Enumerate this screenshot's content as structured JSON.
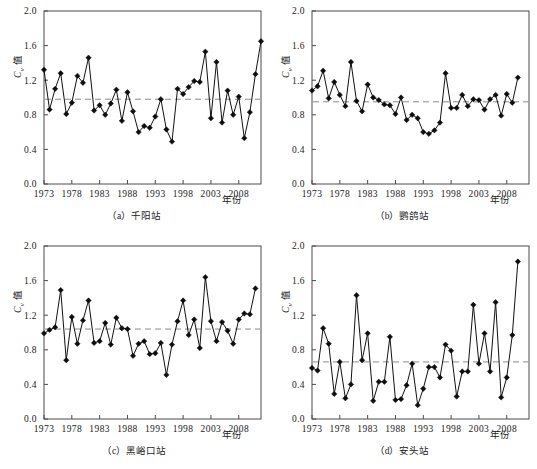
{
  "figure": {
    "ylabel_main": "C",
    "ylabel_sub": "v",
    "ylabel_unit": "值",
    "xlabel": "年份",
    "y_ticks": [
      "0.0",
      "0.4",
      "0.8",
      "1.2",
      "1.6",
      "2.0"
    ],
    "x_ticks": [
      "1973",
      "1978",
      "1983",
      "1988",
      "1993",
      "1998",
      "2003",
      "2008"
    ],
    "line_color": "#111111",
    "mean_color": "#8a8a8a",
    "axis_color": "#4a4a4a",
    "background": "#ffffff"
  },
  "chart_data": [
    {
      "id": "a",
      "type": "line",
      "title": "（a）千阳站",
      "station": "千阳站",
      "xlabel": "年份",
      "ylabel": "Cv 值",
      "ylim": [
        0.0,
        2.0
      ],
      "xlim": [
        1973,
        2012
      ],
      "yticks": [
        0.0,
        0.4,
        0.8,
        1.2,
        1.6,
        2.0
      ],
      "xticks": [
        1973,
        1978,
        1983,
        1988,
        1993,
        1998,
        2003,
        2008
      ],
      "mean": 0.98,
      "grid": false,
      "legend": "none",
      "x": [
        1973,
        1974,
        1975,
        1976,
        1977,
        1978,
        1979,
        1980,
        1981,
        1982,
        1983,
        1984,
        1985,
        1986,
        1987,
        1988,
        1989,
        1990,
        1991,
        1992,
        1993,
        1994,
        1995,
        1996,
        1997,
        1998,
        1999,
        2000,
        2001,
        2002,
        2003,
        2004,
        2005,
        2006,
        2007,
        2008,
        2009,
        2010,
        2011,
        2012
      ],
      "values": [
        1.32,
        0.86,
        1.1,
        1.28,
        0.81,
        0.94,
        1.25,
        1.17,
        1.46,
        0.85,
        0.91,
        0.8,
        0.93,
        1.09,
        0.73,
        1.06,
        0.84,
        0.6,
        0.67,
        0.65,
        0.78,
        0.98,
        0.63,
        0.49,
        1.1,
        1.04,
        1.12,
        1.19,
        1.18,
        1.53,
        0.76,
        1.41,
        0.71,
        1.08,
        0.8,
        1.01,
        0.53,
        0.83,
        1.27,
        1.65
      ]
    },
    {
      "id": "b",
      "type": "line",
      "title": "（b）鹦鸽站",
      "station": "鹦鸽站",
      "xlabel": "年份",
      "ylabel": "Cv 值",
      "ylim": [
        0.0,
        2.0
      ],
      "xlim": [
        1973,
        2012
      ],
      "yticks": [
        0.0,
        0.4,
        0.8,
        1.2,
        1.6,
        2.0
      ],
      "xticks": [
        1973,
        1978,
        1983,
        1988,
        1993,
        1998,
        2003,
        2008
      ],
      "mean": 0.95,
      "grid": false,
      "legend": "none",
      "x": [
        1973,
        1974,
        1975,
        1976,
        1977,
        1978,
        1979,
        1980,
        1981,
        1982,
        1983,
        1984,
        1985,
        1986,
        1987,
        1988,
        1989,
        1990,
        1991,
        1992,
        1993,
        1994,
        1995,
        1996,
        1997,
        1998,
        1999,
        2000,
        2001,
        2002,
        2003,
        2004,
        2005,
        2006,
        2007,
        2008,
        2009,
        2010,
        2011,
        2012
      ],
      "values": [
        1.08,
        1.13,
        1.31,
        0.99,
        1.18,
        1.03,
        0.9,
        1.41,
        0.96,
        0.84,
        1.15,
        1.0,
        0.97,
        0.92,
        0.91,
        0.81,
        1.0,
        0.74,
        0.8,
        0.76,
        0.6,
        0.58,
        0.62,
        0.71,
        1.28,
        0.88,
        0.88,
        1.03,
        0.9,
        0.98,
        0.97,
        0.86,
        0.98,
        1.03,
        0.79,
        1.04,
        0.94,
        1.23
      ]
    },
    {
      "id": "c",
      "type": "line",
      "title": "（c）黑峪口站",
      "station": "黑峪口站",
      "xlabel": "年份",
      "ylabel": "Cv 值",
      "ylim": [
        0.0,
        2.0
      ],
      "xlim": [
        1973,
        2012
      ],
      "yticks": [
        0.0,
        0.4,
        0.8,
        1.2,
        1.6,
        2.0
      ],
      "xticks": [
        1973,
        1978,
        1983,
        1988,
        1993,
        1998,
        2003,
        2008
      ],
      "mean": 1.04,
      "grid": false,
      "legend": "none",
      "x": [
        1973,
        1974,
        1975,
        1976,
        1977,
        1978,
        1979,
        1980,
        1981,
        1982,
        1983,
        1984,
        1985,
        1986,
        1987,
        1988,
        1989,
        1990,
        1991,
        1992,
        1993,
        1994,
        1995,
        1996,
        1997,
        1998,
        1999,
        2000,
        2001,
        2002,
        2003,
        2004,
        2005,
        2006,
        2007,
        2008,
        2009,
        2010,
        2011,
        2012
      ],
      "values": [
        0.99,
        1.03,
        1.06,
        1.49,
        0.68,
        1.18,
        0.87,
        1.14,
        1.37,
        0.88,
        0.9,
        1.11,
        0.86,
        1.17,
        1.05,
        1.04,
        0.73,
        0.87,
        0.9,
        0.75,
        0.76,
        0.88,
        0.51,
        0.86,
        1.13,
        1.37,
        0.97,
        1.15,
        0.82,
        1.64,
        1.13,
        0.9,
        1.12,
        1.02,
        0.87,
        1.15,
        1.22,
        1.21,
        1.51
      ]
    },
    {
      "id": "d",
      "type": "line",
      "title": "（d）安头站",
      "station": "安头站",
      "xlabel": "年份",
      "ylabel": "Cv 值",
      "ylim": [
        0.0,
        2.0
      ],
      "xlim": [
        1973,
        2012
      ],
      "yticks": [
        0.0,
        0.4,
        0.8,
        1.2,
        1.6,
        2.0
      ],
      "xticks": [
        1973,
        1978,
        1983,
        1988,
        1993,
        1998,
        2003,
        2008
      ],
      "mean": 0.66,
      "grid": false,
      "legend": "none",
      "x": [
        1973,
        1974,
        1975,
        1976,
        1977,
        1978,
        1979,
        1980,
        1981,
        1982,
        1983,
        1984,
        1985,
        1986,
        1987,
        1988,
        1989,
        1990,
        1991,
        1992,
        1993,
        1994,
        1995,
        1996,
        1997,
        1998,
        1999,
        2000,
        2001,
        2002,
        2003,
        2004,
        2005,
        2006,
        2007,
        2008,
        2009,
        2010,
        2011,
        2012
      ],
      "values": [
        0.59,
        0.56,
        1.05,
        0.87,
        0.29,
        0.66,
        0.24,
        0.4,
        1.43,
        0.68,
        0.99,
        0.21,
        0.43,
        0.43,
        0.95,
        0.22,
        0.23,
        0.39,
        0.64,
        0.16,
        0.35,
        0.6,
        0.6,
        0.48,
        0.86,
        0.79,
        0.26,
        0.55,
        0.55,
        1.32,
        0.64,
        0.99,
        0.55,
        1.35,
        0.25,
        0.48,
        0.97,
        1.82
      ]
    }
  ]
}
